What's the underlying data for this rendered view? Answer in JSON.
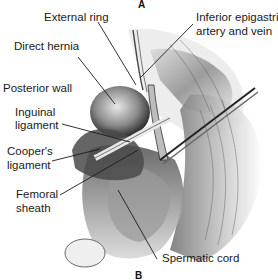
{
  "figure": {
    "panel_top": "A",
    "panel_bottom": "B",
    "labels": {
      "external_ring": "External ring",
      "inferior_epigastric_1": "Inferior epigastric",
      "inferior_epigastric_2": "artery and vein",
      "direct_hernia": "Direct hernia",
      "posterior_wall": "Posterior wall",
      "inguinal_1": "Inguinal",
      "inguinal_2": "ligament",
      "coopers_1": "Cooper's",
      "coopers_2": "ligament",
      "femoral_1": "Femoral",
      "femoral_2": "sheath",
      "spermatic_cord": "Spermatic cord"
    }
  }
}
